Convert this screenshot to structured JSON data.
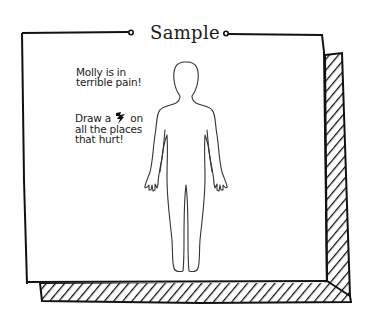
{
  "card": {
    "title": "Sample",
    "border_color": "#111111",
    "background_color": "#ffffff"
  },
  "instructions": {
    "line1": "Molly is in terrible pain!",
    "line2_before_icon": "Draw a",
    "line2_icon": "pain-bolt-icon",
    "line2_after_icon": "on all the places that hurt!"
  },
  "figure": {
    "stroke_color": "#333333"
  }
}
